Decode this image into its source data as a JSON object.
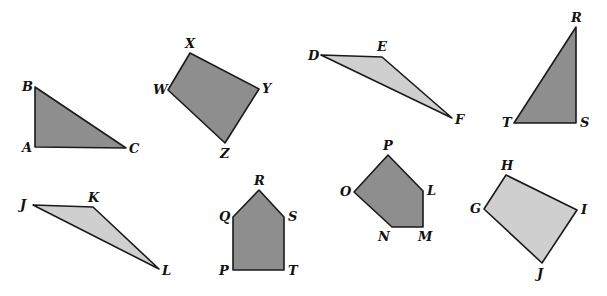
{
  "colors": {
    "dark": "#8e8e8e",
    "light": "#cfcfcf",
    "stroke": "#1a1a1a"
  },
  "shapes": [
    {
      "name": "triangle-abc",
      "fill": "dark",
      "points": "35,87 35,147 126,148",
      "labels": [
        {
          "t": "B",
          "x": 22,
          "y": 91
        },
        {
          "t": "A",
          "x": 22,
          "y": 152
        },
        {
          "t": "C",
          "x": 129,
          "y": 153
        }
      ]
    },
    {
      "name": "quadrilateral-wxyz",
      "fill": "dark",
      "points": "190,53 168,90 225,143 259,89",
      "labels": [
        {
          "t": "X",
          "x": 185,
          "y": 48
        },
        {
          "t": "W",
          "x": 153,
          "y": 94
        },
        {
          "t": "Y",
          "x": 262,
          "y": 93
        },
        {
          "t": "Z",
          "x": 220,
          "y": 158
        }
      ]
    },
    {
      "name": "triangle-def",
      "fill": "light",
      "points": "321,55 382,57 452,118",
      "labels": [
        {
          "t": "D",
          "x": 308,
          "y": 60
        },
        {
          "t": "E",
          "x": 377,
          "y": 51
        },
        {
          "t": "F",
          "x": 455,
          "y": 124
        }
      ]
    },
    {
      "name": "triangle-rst",
      "fill": "dark",
      "points": "576,27 514,123 576,123",
      "labels": [
        {
          "t": "R",
          "x": 571,
          "y": 22
        },
        {
          "t": "T",
          "x": 502,
          "y": 127
        },
        {
          "t": "S",
          "x": 580,
          "y": 127
        }
      ]
    },
    {
      "name": "triangle-jkl",
      "fill": "light",
      "points": "33,205 93,207 159,269",
      "labels": [
        {
          "t": "J",
          "x": 20,
          "y": 209
        },
        {
          "t": "K",
          "x": 88,
          "y": 202
        },
        {
          "t": "L",
          "x": 162,
          "y": 275
        }
      ]
    },
    {
      "name": "pentagon-pqrst",
      "fill": "dark",
      "points": "259,190 233,217 233,270 284,270 284,217",
      "labels": [
        {
          "t": "R",
          "x": 254,
          "y": 185
        },
        {
          "t": "Q",
          "x": 219,
          "y": 221
        },
        {
          "t": "S",
          "x": 288,
          "y": 221
        },
        {
          "t": "P",
          "x": 219,
          "y": 275
        },
        {
          "t": "T",
          "x": 288,
          "y": 275
        }
      ]
    },
    {
      "name": "pentagon-lmnop",
      "fill": "dark",
      "points": "388,155 354,192 392,227 423,227 423,191",
      "labels": [
        {
          "t": "P",
          "x": 383,
          "y": 150
        },
        {
          "t": "O",
          "x": 340,
          "y": 196
        },
        {
          "t": "L",
          "x": 427,
          "y": 195
        },
        {
          "t": "N",
          "x": 378,
          "y": 241
        },
        {
          "t": "M",
          "x": 418,
          "y": 241
        }
      ]
    },
    {
      "name": "quadrilateral-ghij",
      "fill": "light",
      "points": "506,175 484,209 542,263 577,210",
      "labels": [
        {
          "t": "H",
          "x": 501,
          "y": 170
        },
        {
          "t": "G",
          "x": 470,
          "y": 213
        },
        {
          "t": "I",
          "x": 581,
          "y": 214
        },
        {
          "t": "J",
          "x": 537,
          "y": 278
        }
      ]
    }
  ]
}
